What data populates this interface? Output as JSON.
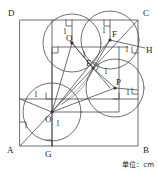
{
  "figure": {
    "type": "geometry-diagram",
    "caption": "单位：cm",
    "square": {
      "vertices": [
        {
          "label": "D",
          "position": "top-left"
        },
        {
          "label": "C",
          "position": "top-right"
        },
        {
          "label": "B",
          "position": "bottom-right"
        },
        {
          "label": "A",
          "position": "bottom-left"
        }
      ]
    },
    "points": [
      {
        "label": "Q",
        "role": "circle-center"
      },
      {
        "label": "F",
        "role": "circle-center"
      },
      {
        "label": "P",
        "role": "circle-center"
      },
      {
        "label": "O",
        "role": "circle-center"
      },
      {
        "label": "E",
        "role": "intersection"
      },
      {
        "label": "G",
        "role": "foot-on-AB"
      },
      {
        "label": "H",
        "role": "foot-on-BC"
      }
    ],
    "length_labels": [
      {
        "text": "1",
        "near": "Q-top"
      },
      {
        "text": "1",
        "near": "F-top"
      },
      {
        "text": "1",
        "near": "Q-E"
      },
      {
        "text": "1",
        "near": "F-H"
      },
      {
        "text": "1",
        "near": "E-P"
      },
      {
        "text": "1",
        "near": "P-right"
      },
      {
        "text": "1",
        "near": "O-left"
      },
      {
        "text": "1",
        "near": "O-G"
      }
    ],
    "units": "cm"
  }
}
